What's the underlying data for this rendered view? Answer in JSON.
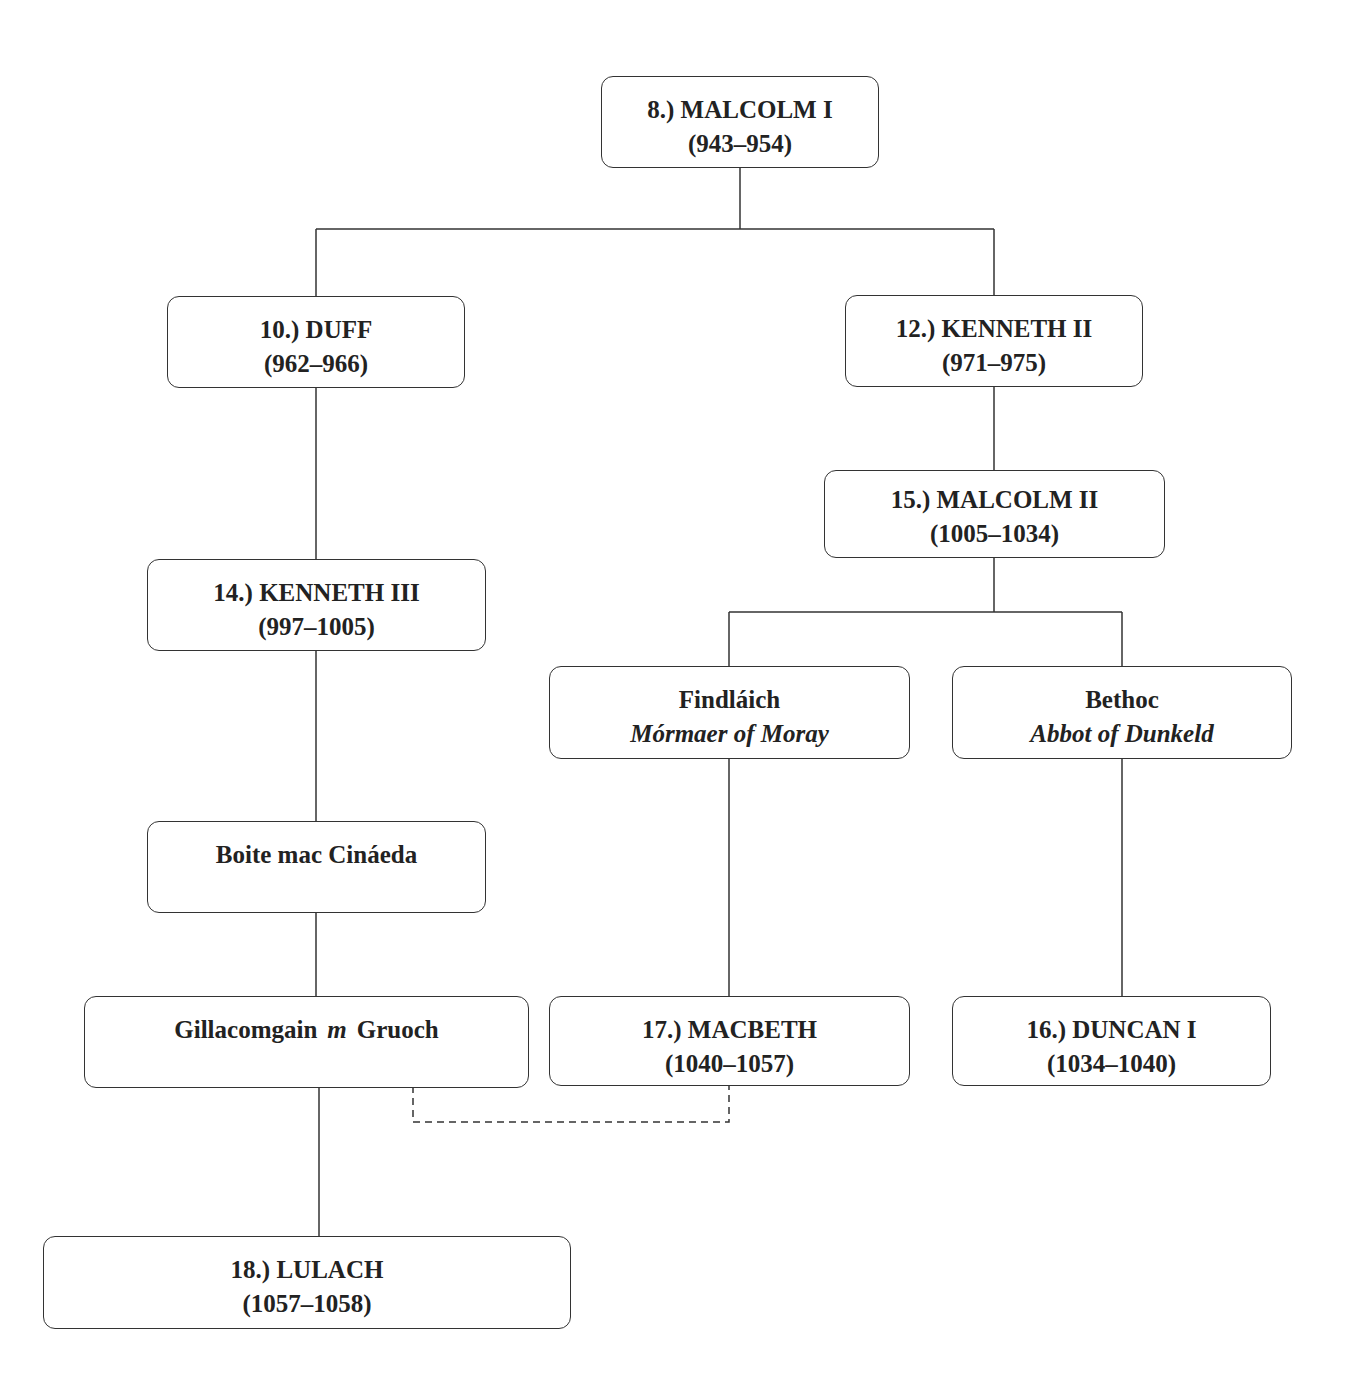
{
  "diagram": {
    "type": "family-tree",
    "nodes": {
      "malcolm1": {
        "line1": "8.) MALCOLM I",
        "line2": "(943–954)"
      },
      "duff": {
        "line1": "10.) DUFF",
        "line2": "(962–966)"
      },
      "kenneth2": {
        "line1": "12.) KENNETH II",
        "line2": "(971–975)"
      },
      "malcolm2": {
        "line1": "15.) MALCOLM II",
        "line2": "(1005–1034)"
      },
      "kenneth3": {
        "line1": "14.) KENNETH III",
        "line2": "(997–1005)"
      },
      "findlaich": {
        "line1": "Findláich",
        "line2": "Mórmaer of Moray"
      },
      "bethoc": {
        "line1": "Bethoc",
        "line2": "Abbot of Dunkeld"
      },
      "boite": {
        "line1": "Boite mac Cináeda"
      },
      "gillacomgain": {
        "name": "Gillacomgain",
        "marriage": "m",
        "spouse": "Gruoch"
      },
      "macbeth": {
        "line1": "17.) MACBETH",
        "line2": "(1040–1057)"
      },
      "duncan1": {
        "line1": "16.) DUNCAN I",
        "line2": "(1034–1040)"
      },
      "lulach": {
        "line1": "18.) LULACH",
        "line2": "(1057–1058)"
      }
    },
    "edges": [
      {
        "from": "malcolm1",
        "to": "duff",
        "style": "solid"
      },
      {
        "from": "malcolm1",
        "to": "kenneth2",
        "style": "solid"
      },
      {
        "from": "kenneth2",
        "to": "malcolm2",
        "style": "solid"
      },
      {
        "from": "duff",
        "to": "kenneth3",
        "style": "solid"
      },
      {
        "from": "malcolm2",
        "to": "findlaich",
        "style": "solid"
      },
      {
        "from": "malcolm2",
        "to": "bethoc",
        "style": "solid"
      },
      {
        "from": "kenneth3",
        "to": "boite",
        "style": "solid"
      },
      {
        "from": "boite",
        "to": "gillacomgain",
        "style": "solid"
      },
      {
        "from": "findlaich",
        "to": "macbeth",
        "style": "solid"
      },
      {
        "from": "bethoc",
        "to": "duncan1",
        "style": "solid"
      },
      {
        "from": "gillacomgain",
        "to": "lulach",
        "style": "solid"
      },
      {
        "from": "gillacomgain",
        "to": "macbeth",
        "style": "dashed",
        "meaning": "Gruoch later married Macbeth"
      }
    ]
  }
}
